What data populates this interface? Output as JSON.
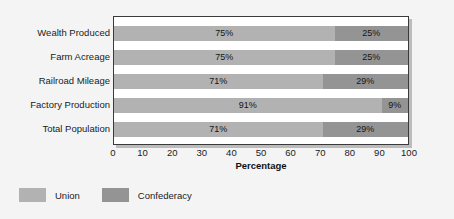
{
  "chart_data": {
    "type": "bar",
    "orientation": "horizontal",
    "stacked": true,
    "title": "",
    "xlabel": "Percentage",
    "ylabel": "",
    "xlim": [
      0,
      100
    ],
    "xticks": [
      0,
      10,
      20,
      30,
      40,
      50,
      60,
      70,
      80,
      90,
      100
    ],
    "grid": false,
    "legend_position": "below-left",
    "categories": [
      "Wealth Produced",
      "Farm Acreage",
      "Railroad Mileage",
      "Factory Production",
      "Total Population"
    ],
    "series": [
      {
        "name": "Union",
        "color": "#b2b2b2",
        "values": [
          75,
          75,
          71,
          91,
          71
        ],
        "labels": [
          "75%",
          "75%",
          "71%",
          "91%",
          "71%"
        ]
      },
      {
        "name": "Confederacy",
        "color": "#949494",
        "values": [
          25,
          25,
          29,
          9,
          29
        ],
        "labels": [
          "25%",
          "25%",
          "29%",
          "9%",
          "29%"
        ]
      }
    ]
  },
  "legend": {
    "items": [
      {
        "label": "Union",
        "color": "#b2b2b2"
      },
      {
        "label": "Confederacy",
        "color": "#949494"
      }
    ]
  },
  "axis": {
    "x_title": "Percentage",
    "tick_labels": [
      "0",
      "10",
      "20",
      "30",
      "40",
      "50",
      "60",
      "70",
      "80",
      "90",
      "100"
    ]
  }
}
